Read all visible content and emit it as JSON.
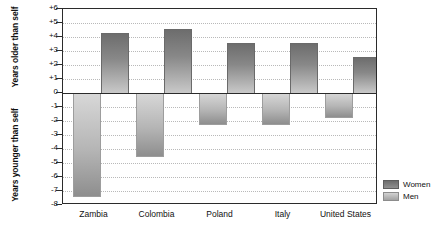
{
  "chart_data": {
    "type": "bar",
    "title": "",
    "subtitle": "",
    "xlabel": "",
    "ylabel": "Years older than self / Years younger than self",
    "ylabel_upper": "Years older than self",
    "ylabel_lower": "Years younger than self",
    "categories": [
      "Zambia",
      "Colombia",
      "Poland",
      "Italy",
      "United States"
    ],
    "series": [
      {
        "name": "Women",
        "values": [
          4.3,
          4.6,
          3.6,
          3.6,
          2.6
        ],
        "color": "#7a7a7a"
      },
      {
        "name": "Men",
        "values": [
          -7.4,
          -4.6,
          -2.3,
          -2.3,
          -1.8
        ],
        "color": "#bdbdbd"
      }
    ],
    "ylim": [
      -8,
      6
    ],
    "ytick_values": [
      6,
      5,
      4,
      3,
      2,
      1,
      0,
      -1,
      -2,
      -3,
      -4,
      -5,
      -6,
      -7,
      -8
    ],
    "ytick_labels": [
      "+6",
      "+5",
      "+4",
      "+3",
      "+2",
      "+1",
      "0",
      "-1",
      "-2",
      "-3",
      "-4",
      "-5",
      "-6",
      "-7",
      "-8"
    ],
    "grid": true,
    "grid_style": "dotted-horizontal",
    "zero_line": true,
    "legend_position": "right",
    "legend_entries": [
      "Women",
      "Men"
    ]
  },
  "legend": {
    "women_label": "Women",
    "men_label": "Men"
  }
}
